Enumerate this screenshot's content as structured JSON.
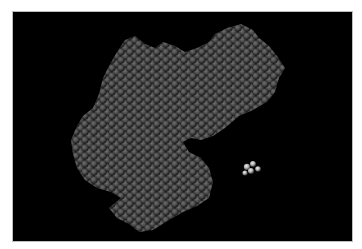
{
  "scene": {
    "type": "molecular-structure-render",
    "style": "space-filling",
    "background_color": "#000000",
    "frame_color": "#ffffff",
    "protein": {
      "color_base": "#474747",
      "color_highlight": "#6b6b6b",
      "color_shadow": "#1e1e1e"
    },
    "ligand": {
      "color": "#d8d8d8",
      "position": [
        245,
        162
      ]
    }
  }
}
